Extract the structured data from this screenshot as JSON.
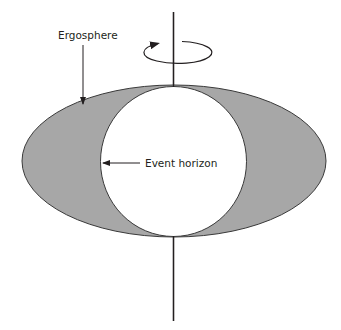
{
  "diagram": {
    "labels": {
      "ergosphere": "Ergosphere",
      "event_horizon": "Event horizon"
    },
    "colors": {
      "ergosphere_fill": "#a7a7a7",
      "stroke": "#3a3a3a",
      "horizon_fill": "#ffffff",
      "background": "#ffffff"
    },
    "elements": {
      "rotation_axis": "vertical-line",
      "rotation_indicator": "circular-arrow-icon"
    }
  }
}
